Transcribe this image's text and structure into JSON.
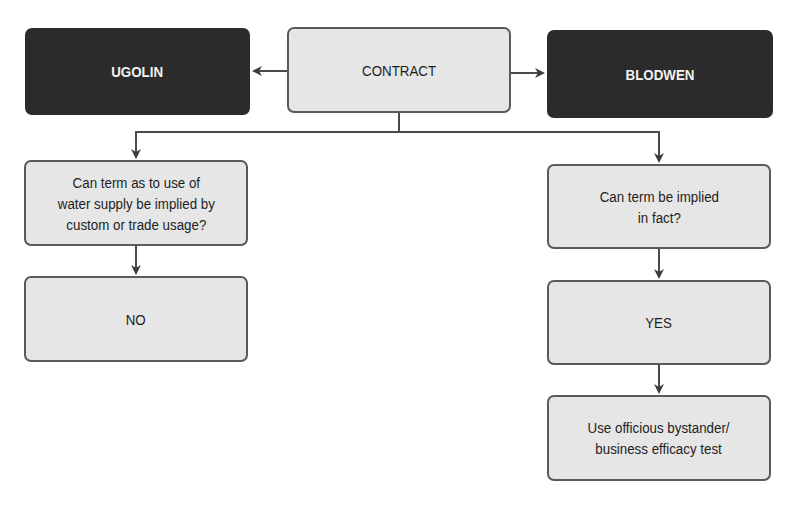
{
  "diagram": {
    "parties": {
      "left": "UGOLIN",
      "center": "CONTRACT",
      "right": "BLODWEN"
    },
    "left_branch": {
      "question": "Can term as to use of water supply be implied by custom or trade usage?",
      "question_lines": [
        "Can term as to use of",
        "water supply be implied by",
        "custom or trade usage?"
      ],
      "answer": "NO"
    },
    "right_branch": {
      "question_lines": [
        "Can term be implied",
        "in fact?"
      ],
      "answer": "YES",
      "outcome_lines": [
        "Use officious bystander/",
        "business efficacy test"
      ]
    },
    "colors": {
      "dark_box": "#2b2b2b",
      "light_box": "#e6e6e6",
      "line": "#4a4a4a"
    }
  }
}
